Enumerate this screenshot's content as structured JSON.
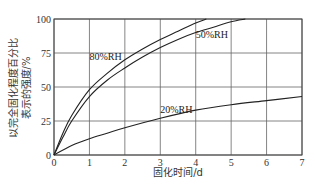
{
  "chart_data": {
    "type": "line",
    "title": "",
    "xlabel": "固化时间/d",
    "ylabel_lines": [
      "以完全固化程度百分比",
      "表示的强度/%"
    ],
    "xlim": [
      0,
      7
    ],
    "ylim": [
      0,
      100
    ],
    "x_ticks": [
      "0",
      "1",
      "2",
      "3",
      "4",
      "5",
      "6",
      "7"
    ],
    "y_ticks": [
      "0",
      "25",
      "50",
      "75",
      "100"
    ],
    "grid": true,
    "legend": "inline labels",
    "series": [
      {
        "name": "80%RH",
        "x": [
          0,
          0.25,
          0.5,
          1,
          1.5,
          2,
          2.5,
          3,
          3.5,
          4,
          4.3
        ],
        "values": [
          0,
          16,
          29,
          48,
          60,
          70,
          78,
          85,
          91,
          97,
          100
        ]
      },
      {
        "name": "50%RH",
        "x": [
          0,
          0.25,
          0.5,
          1,
          1.5,
          2,
          2.5,
          3,
          3.5,
          4,
          4.5,
          5,
          5.4
        ],
        "values": [
          0,
          13,
          25,
          43,
          55,
          64,
          72,
          79,
          85,
          90,
          94,
          98,
          100
        ]
      },
      {
        "name": "20%RH",
        "x": [
          0,
          0.5,
          1,
          1.5,
          2,
          3,
          4,
          5,
          6,
          7
        ],
        "values": [
          0,
          7,
          12,
          16,
          20,
          27,
          33,
          37,
          40,
          43
        ]
      }
    ],
    "annotations": [
      {
        "text": "80%RH",
        "x": 1.0,
        "y": 70
      },
      {
        "text": "50%RH",
        "x": 4.0,
        "y": 86
      },
      {
        "text": "20%RH",
        "x": 3.0,
        "y": 31
      }
    ]
  }
}
